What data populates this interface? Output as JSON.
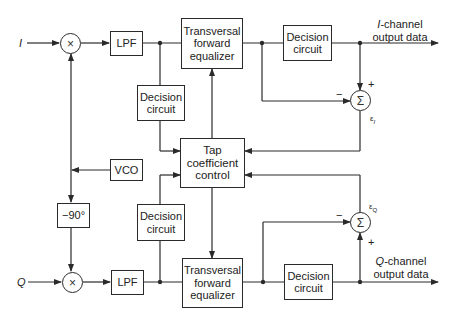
{
  "diagram": {
    "inputs": {
      "i": "I",
      "q": "Q"
    },
    "blocks": {
      "mixer_i": "×",
      "mixer_q": "×",
      "lpf_i": "LPF",
      "lpf_q": "LPF",
      "equalizer_i": [
        "Transversal",
        "forward",
        "equalizer"
      ],
      "equalizer_q": [
        "Transversal",
        "forward",
        "equalizer"
      ],
      "decision_tap_i": [
        "Decision",
        "circuit"
      ],
      "decision_tap_q": [
        "Decision",
        "circuit"
      ],
      "decision_out_i": [
        "Decision",
        "circuit"
      ],
      "decision_out_q": [
        "Decision",
        "circuit"
      ],
      "tap_control": [
        "Tap",
        "coefficient",
        "control"
      ],
      "vco": "VCO",
      "phase_shift": "−90°",
      "sum_i": "Σ",
      "sum_q": "Σ"
    },
    "outputs": {
      "i": {
        "prefix": "I",
        "suffix": "-channel",
        "line2": "output data"
      },
      "q": {
        "prefix": "Q",
        "suffix": "-channel",
        "line2": "output data"
      }
    },
    "signs": {
      "plus": "+",
      "minus": "−"
    },
    "errors": {
      "i": "ε",
      "i_sub": "I",
      "q": "ε",
      "q_sub": "Q"
    }
  }
}
